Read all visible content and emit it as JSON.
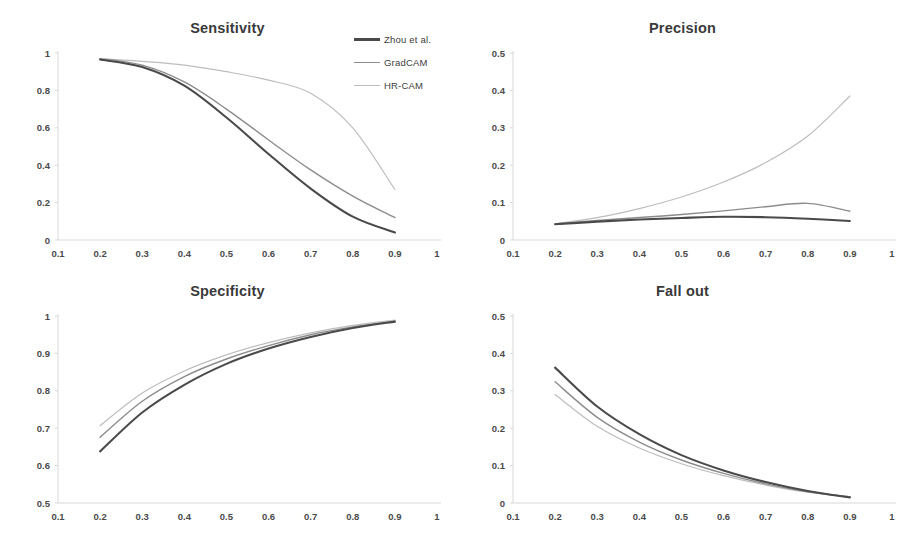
{
  "figure": {
    "background": "#ffffff",
    "legend": {
      "position": "top-center-right",
      "entries": [
        {
          "label": "Zhou et al.",
          "color": "#4a4a4a"
        },
        {
          "label": "GradCAM",
          "color": "#8c8c8c"
        },
        {
          "label": "HR-CAM",
          "color": "#bdbdbd"
        }
      ]
    }
  },
  "chart_data": [
    {
      "id": "sensitivity",
      "type": "line",
      "title": "Sensitivity",
      "xlabel": "",
      "ylabel": "",
      "xlim": [
        0.1,
        1.0
      ],
      "ylim": [
        0,
        1
      ],
      "xticks": [
        "0.1",
        "0.2",
        "0.3",
        "0.4",
        "0.5",
        "0.6",
        "0.7",
        "0.8",
        "0.9",
        "1"
      ],
      "yticks": [
        "0",
        "0.2",
        "0.4",
        "0.6",
        "0.8",
        "1"
      ],
      "grid": false,
      "x": [
        0.2,
        0.3,
        0.4,
        0.5,
        0.6,
        0.7,
        0.8,
        0.9
      ],
      "series": [
        {
          "name": "Zhou et al.",
          "color": "#4a4a4a",
          "values": [
            0.965,
            0.925,
            0.825,
            0.655,
            0.46,
            0.275,
            0.125,
            0.04
          ]
        },
        {
          "name": "GradCAM",
          "color": "#8c8c8c",
          "values": [
            0.97,
            0.935,
            0.845,
            0.7,
            0.535,
            0.375,
            0.235,
            0.12
          ]
        },
        {
          "name": "HR-CAM",
          "color": "#bdbdbd",
          "values": [
            0.97,
            0.955,
            0.935,
            0.9,
            0.855,
            0.785,
            0.6,
            0.27
          ]
        }
      ]
    },
    {
      "id": "precision",
      "type": "line",
      "title": "Precision",
      "xlabel": "",
      "ylabel": "",
      "xlim": [
        0.1,
        1.0
      ],
      "ylim": [
        0,
        0.5
      ],
      "xticks": [
        "0.1",
        "0.2",
        "0.3",
        "0.4",
        "0.5",
        "0.6",
        "0.7",
        "0.8",
        "0.9",
        "1"
      ],
      "yticks": [
        "0",
        "0.1",
        "0.2",
        "0.3",
        "0.4",
        "0.5"
      ],
      "grid": false,
      "x": [
        0.2,
        0.3,
        0.4,
        0.5,
        0.6,
        0.7,
        0.8,
        0.9
      ],
      "series": [
        {
          "name": "Zhou et al.",
          "color": "#4a4a4a",
          "values": [
            0.042,
            0.049,
            0.055,
            0.059,
            0.062,
            0.061,
            0.057,
            0.051
          ]
        },
        {
          "name": "GradCAM",
          "color": "#8c8c8c",
          "values": [
            0.043,
            0.052,
            0.06,
            0.068,
            0.078,
            0.089,
            0.098,
            0.077
          ]
        },
        {
          "name": "HR-CAM",
          "color": "#bdbdbd",
          "values": [
            0.044,
            0.06,
            0.084,
            0.115,
            0.155,
            0.207,
            0.278,
            0.385
          ]
        }
      ]
    },
    {
      "id": "specificity",
      "type": "line",
      "title": "Specificity",
      "xlabel": "",
      "ylabel": "",
      "xlim": [
        0.1,
        1.0
      ],
      "ylim": [
        0.5,
        1.0
      ],
      "xticks": [
        "0.1",
        "0.2",
        "0.3",
        "0.4",
        "0.5",
        "0.6",
        "0.7",
        "0.8",
        "0.9",
        "1"
      ],
      "yticks": [
        "0.5",
        "0.6",
        "0.7",
        "0.8",
        "0.9",
        "1"
      ],
      "grid": false,
      "x": [
        0.2,
        0.3,
        0.4,
        0.5,
        0.6,
        0.7,
        0.8,
        0.9
      ],
      "series": [
        {
          "name": "Zhou et al.",
          "color": "#4a4a4a",
          "values": [
            0.638,
            0.742,
            0.816,
            0.872,
            0.913,
            0.944,
            0.968,
            0.985
          ]
        },
        {
          "name": "GradCAM",
          "color": "#8c8c8c",
          "values": [
            0.676,
            0.772,
            0.838,
            0.885,
            0.921,
            0.95,
            0.971,
            0.986
          ]
        },
        {
          "name": "HR-CAM",
          "color": "#bdbdbd",
          "values": [
            0.707,
            0.794,
            0.853,
            0.896,
            0.929,
            0.955,
            0.975,
            0.989
          ]
        }
      ]
    },
    {
      "id": "fall-out",
      "type": "line",
      "title": "Fall out",
      "xlabel": "",
      "ylabel": "",
      "xlim": [
        0.1,
        1.0
      ],
      "ylim": [
        0,
        0.5
      ],
      "xticks": [
        "0.1",
        "0.2",
        "0.3",
        "0.4",
        "0.5",
        "0.6",
        "0.7",
        "0.8",
        "0.9",
        "1"
      ],
      "yticks": [
        "0",
        "0.1",
        "0.2",
        "0.3",
        "0.4",
        "0.5"
      ],
      "grid": false,
      "x": [
        0.2,
        0.3,
        0.4,
        0.5,
        0.6,
        0.7,
        0.8,
        0.9
      ],
      "series": [
        {
          "name": "Zhou et al.",
          "color": "#4a4a4a",
          "values": [
            0.362,
            0.258,
            0.184,
            0.128,
            0.087,
            0.056,
            0.032,
            0.015
          ]
        },
        {
          "name": "GradCAM",
          "color": "#8c8c8c",
          "values": [
            0.324,
            0.229,
            0.163,
            0.115,
            0.079,
            0.051,
            0.03,
            0.016
          ]
        },
        {
          "name": "HR-CAM",
          "color": "#bdbdbd",
          "values": [
            0.29,
            0.205,
            0.147,
            0.105,
            0.073,
            0.048,
            0.029,
            0.017
          ]
        }
      ]
    }
  ]
}
